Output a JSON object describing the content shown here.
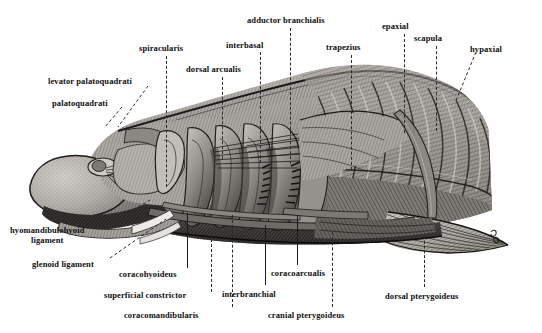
{
  "figure": {
    "background_color": "#ffffff",
    "ink_color": "#101010",
    "leader_color": "#2a2a2a"
  },
  "labels": [
    {
      "id": "levator-palatoquadrati",
      "text": "levator palatoquadrati",
      "x": 48,
      "y": 77,
      "anchor": "start"
    },
    {
      "id": "palatoquadrati",
      "text": "palatoquadrati",
      "x": 52,
      "y": 99,
      "anchor": "start"
    },
    {
      "id": "spiracularis",
      "text": "spiracularis",
      "x": 139,
      "y": 44,
      "anchor": "start"
    },
    {
      "id": "dorsal-arcualis",
      "text": "dorsal arcualis",
      "x": 186,
      "y": 65,
      "anchor": "start"
    },
    {
      "id": "interbasal",
      "text": "interbasal",
      "x": 226,
      "y": 41,
      "anchor": "start"
    },
    {
      "id": "adductor-branchialis",
      "text": "adductor branchialis",
      "x": 247,
      "y": 16,
      "anchor": "start"
    },
    {
      "id": "trapezius",
      "text": "trapezius",
      "x": 326,
      "y": 43,
      "anchor": "start"
    },
    {
      "id": "epaxial",
      "text": "epaxial",
      "x": 382,
      "y": 22,
      "anchor": "start"
    },
    {
      "id": "scapula",
      "text": "scapula",
      "x": 414,
      "y": 34,
      "anchor": "start"
    },
    {
      "id": "hypaxial",
      "text": "hypaxial",
      "x": 470,
      "y": 45,
      "anchor": "start"
    },
    {
      "id": "hyomandibulohyoid-ligament",
      "text": "hyomandibulohyoid\nligament",
      "x": 10,
      "y": 226,
      "anchor": "start"
    },
    {
      "id": "glenoid-ligament",
      "text": "glenoid ligament",
      "x": 32,
      "y": 260,
      "anchor": "start"
    },
    {
      "id": "coracohyoideus",
      "text": "coracohyoideus",
      "x": 119,
      "y": 270,
      "anchor": "start"
    },
    {
      "id": "superficial-constrictor",
      "text": "superficial constrictor",
      "x": 104,
      "y": 291,
      "anchor": "start"
    },
    {
      "id": "coracomandibularis",
      "text": "coracomandibularis",
      "x": 124,
      "y": 311,
      "anchor": "start"
    },
    {
      "id": "interbranchial",
      "text": "interbranchial",
      "x": 222,
      "y": 290,
      "anchor": "start"
    },
    {
      "id": "coracoarcualis",
      "text": "coracoarcualis",
      "x": 271,
      "y": 269,
      "anchor": "start"
    },
    {
      "id": "cranial-pterygoideus",
      "text": "cranial pterygoideus",
      "x": 268,
      "y": 311,
      "anchor": "start"
    },
    {
      "id": "dorsal-pterygoideus",
      "text": "dorsal pterygoideus",
      "x": 385,
      "y": 292,
      "anchor": "start"
    }
  ],
  "leaders": [
    {
      "id": "leader-spiracularis",
      "x": 166,
      "y": 56,
      "len": 131,
      "style": "dashed"
    },
    {
      "id": "leader-dorsal-arcualis",
      "x": 222,
      "y": 77,
      "len": 82,
      "style": "dashed"
    },
    {
      "id": "leader-interbasal",
      "x": 260,
      "y": 52,
      "len": 111,
      "style": "dashed"
    },
    {
      "id": "leader-adductor-branchialis",
      "x": 290,
      "y": 28,
      "len": 136,
      "style": "dashed"
    },
    {
      "id": "leader-trapezius",
      "x": 351,
      "y": 55,
      "len": 115,
      "style": "dashed"
    },
    {
      "id": "leader-epaxial",
      "x": 404,
      "y": 34,
      "len": 99,
      "style": "dashed"
    },
    {
      "id": "leader-scapula",
      "x": 436,
      "y": 46,
      "len": 85,
      "style": "dashed"
    },
    {
      "id": "leader-coracohyoideus",
      "x": 187,
      "y": 213,
      "len": 55,
      "style": "solid"
    },
    {
      "id": "leader-superficial-constrictor",
      "x": 211,
      "y": 234,
      "len": 58,
      "style": "dashed"
    },
    {
      "id": "leader-coracomandibularis",
      "x": 232,
      "y": 215,
      "len": 92,
      "style": "dashed"
    },
    {
      "id": "leader-interbranchial",
      "x": 265,
      "y": 225,
      "len": 60,
      "style": "solid"
    },
    {
      "id": "leader-coracoarcualis",
      "x": 297,
      "y": 215,
      "len": 50,
      "style": "solid"
    },
    {
      "id": "leader-cranial-pterygoideus",
      "x": 332,
      "y": 232,
      "len": 75,
      "style": "dashed"
    },
    {
      "id": "leader-dorsal-pterygoideus",
      "x": 424,
      "y": 236,
      "len": 51,
      "style": "dashed"
    }
  ],
  "pointer_leaders": [
    {
      "id": "leader-levator-palatoquadrati",
      "x1": 148,
      "y1": 86,
      "x2": 118,
      "y2": 127
    },
    {
      "id": "leader-palatoquadrati",
      "x1": 122,
      "y1": 107,
      "x2": 104,
      "y2": 128
    },
    {
      "id": "leader-hyomandibulohyoid",
      "x1": 110,
      "y1": 224,
      "x2": 150,
      "y2": 200
    },
    {
      "id": "leader-glenoid-ligament",
      "x1": 110,
      "y1": 258,
      "x2": 166,
      "y2": 219
    },
    {
      "id": "leader-hypaxial",
      "x1": 476,
      "y1": 52,
      "x2": 455,
      "y2": 103
    }
  ]
}
